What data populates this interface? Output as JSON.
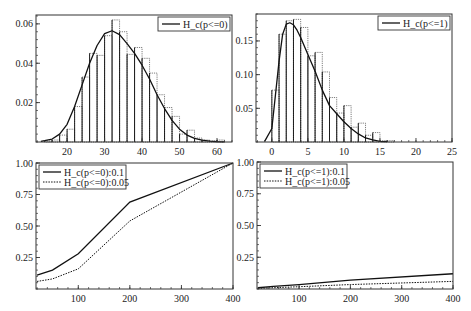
{
  "chart_data": [
    {
      "id": "hist_p0",
      "type": "bar",
      "subtype": "histogram_with_density",
      "title": "",
      "xlabel": "",
      "ylabel": "",
      "xlim": [
        11.7,
        64
      ],
      "ylim": [
        0,
        0.0645
      ],
      "xticks": [
        20,
        30,
        40,
        50,
        60
      ],
      "yticks": [
        0.02,
        0.04,
        0.06
      ],
      "ytick_labels": [
        "0.02",
        "0.04",
        "0.06"
      ],
      "xtick_labels": [
        "20",
        "30",
        "40",
        "50",
        "60"
      ],
      "grid": false,
      "legend": {
        "position": "upper right",
        "entries": [
          {
            "label": "H_c(p<=0)",
            "style": "solid"
          }
        ]
      },
      "bin_width": 2,
      "bins": [
        {
          "x0": 14,
          "h": 0.0005
        },
        {
          "x0": 16,
          "h": 0.001
        },
        {
          "x0": 18,
          "h": 0.0035
        },
        {
          "x0": 20,
          "h": 0.0065
        },
        {
          "x0": 22,
          "h": 0.018
        },
        {
          "x0": 24,
          "h": 0.033
        },
        {
          "x0": 26,
          "h": 0.045
        },
        {
          "x0": 28,
          "h": 0.044
        },
        {
          "x0": 30,
          "h": 0.054
        },
        {
          "x0": 32,
          "h": 0.062
        },
        {
          "x0": 34,
          "h": 0.056
        },
        {
          "x0": 36,
          "h": 0.0445
        },
        {
          "x0": 38,
          "h": 0.048
        },
        {
          "x0": 40,
          "h": 0.0425
        },
        {
          "x0": 42,
          "h": 0.035
        },
        {
          "x0": 44,
          "h": 0.024
        },
        {
          "x0": 46,
          "h": 0.0175
        },
        {
          "x0": 48,
          "h": 0.013
        },
        {
          "x0": 50,
          "h": 0.004
        },
        {
          "x0": 52,
          "h": 0.006
        },
        {
          "x0": 54,
          "h": 0.002
        },
        {
          "x0": 56,
          "h": 0.001
        },
        {
          "x0": 58,
          "h": 0.0005
        },
        {
          "x0": 60,
          "h": 0.001
        }
      ],
      "density": {
        "x": [
          13,
          16,
          18,
          20,
          22,
          24,
          26,
          28,
          30,
          32,
          34,
          36,
          38,
          40,
          42,
          44,
          46,
          48,
          50,
          52,
          54,
          56,
          58,
          60,
          62
        ],
        "y": [
          0.0003,
          0.0015,
          0.004,
          0.009,
          0.018,
          0.029,
          0.04,
          0.049,
          0.055,
          0.0565,
          0.0545,
          0.05,
          0.045,
          0.039,
          0.032,
          0.024,
          0.017,
          0.011,
          0.0065,
          0.0035,
          0.0018,
          0.0009,
          0.0004,
          0.0002,
          0.0001
        ]
      }
    },
    {
      "id": "hist_p1",
      "type": "bar",
      "subtype": "histogram_with_density",
      "title": "",
      "xlabel": "",
      "ylabel": "",
      "xlim": [
        -2.2,
        25
      ],
      "ylim": [
        0,
        0.19
      ],
      "xticks": [
        0,
        5,
        10,
        15,
        20,
        25
      ],
      "xtick_labels": [
        "0",
        "5",
        "10",
        "15",
        "20",
        "25"
      ],
      "yticks": [
        0.05,
        0.1,
        0.15
      ],
      "ytick_labels": [
        "0.05",
        "0.10",
        "0.15"
      ],
      "grid": false,
      "legend": {
        "position": "upper right",
        "entries": [
          {
            "label": "H_c(p<=1)",
            "style": "solid"
          }
        ]
      },
      "bin_width": 1,
      "bins": [
        {
          "x0": 0,
          "h": 0.077
        },
        {
          "x0": 1,
          "h": 0.16
        },
        {
          "x0": 2,
          "h": 0.18
        },
        {
          "x0": 3,
          "h": 0.182
        },
        {
          "x0": 4,
          "h": 0.17
        },
        {
          "x0": 5,
          "h": 0.128
        },
        {
          "x0": 6,
          "h": 0.133
        },
        {
          "x0": 7,
          "h": 0.104
        },
        {
          "x0": 8,
          "h": 0.066
        },
        {
          "x0": 9,
          "h": 0.043
        },
        {
          "x0": 10,
          "h": 0.054
        },
        {
          "x0": 11,
          "h": 0.022
        },
        {
          "x0": 12,
          "h": 0.028
        },
        {
          "x0": 13,
          "h": 0.01
        },
        {
          "x0": 14,
          "h": 0.014
        },
        {
          "x0": 15,
          "h": 0.002
        },
        {
          "x0": 16,
          "h": 0.002
        }
      ],
      "density": {
        "x": [
          -1,
          0,
          0.5,
          1,
          1.5,
          2,
          2.5,
          3,
          3.5,
          4,
          5,
          6,
          7,
          8,
          9,
          10,
          11,
          12,
          13,
          14,
          15,
          16
        ],
        "y": [
          0.001,
          0.02,
          0.07,
          0.12,
          0.16,
          0.175,
          0.177,
          0.174,
          0.166,
          0.155,
          0.13,
          0.105,
          0.077,
          0.054,
          0.042,
          0.03,
          0.02,
          0.012,
          0.006,
          0.003,
          0.001,
          0.0005
        ]
      }
    },
    {
      "id": "power_p0",
      "type": "line",
      "title": "",
      "xlabel": "",
      "ylabel": "",
      "xlim": [
        18,
        400
      ],
      "ylim": [
        0,
        1.0
      ],
      "xticks": [
        100,
        200,
        300,
        400
      ],
      "xtick_labels": [
        "100",
        "200",
        "300",
        "400"
      ],
      "yticks": [
        0.25,
        0.5,
        0.75,
        1.0
      ],
      "ytick_labels": [
        "0.25",
        "0.50",
        "0.75",
        "1.00"
      ],
      "grid": false,
      "legend": {
        "position": "upper left"
      },
      "x": [
        20,
        50,
        100,
        200,
        400
      ],
      "series": [
        {
          "name": "H_c(p<=0):0.1",
          "style": "solid",
          "values": [
            0.11,
            0.15,
            0.28,
            0.69,
            1.0
          ]
        },
        {
          "name": "H_c(p<=0):0.05",
          "style": "dotted",
          "values": [
            0.06,
            0.08,
            0.16,
            0.54,
            1.0
          ]
        }
      ]
    },
    {
      "id": "power_p1",
      "type": "line",
      "title": "",
      "xlabel": "",
      "ylabel": "",
      "xlim": [
        18,
        400
      ],
      "ylim": [
        0,
        1.0
      ],
      "xticks": [
        100,
        200,
        300,
        400
      ],
      "xtick_labels": [
        "100",
        "200",
        "300",
        "400"
      ],
      "yticks": [
        0.25,
        0.5,
        0.75,
        1.0
      ],
      "ytick_labels": [
        "0.25",
        "0.50",
        "0.75",
        "1.00"
      ],
      "grid": false,
      "legend": {
        "position": "upper left"
      },
      "x": [
        20,
        50,
        100,
        200,
        400
      ],
      "series": [
        {
          "name": "H_c(p<=1):0.1",
          "style": "solid",
          "values": [
            0.01,
            0.02,
            0.035,
            0.07,
            0.12
          ]
        },
        {
          "name": "H_c(p<=1):0.05",
          "style": "dotted",
          "values": [
            0.005,
            0.01,
            0.018,
            0.035,
            0.06
          ]
        }
      ]
    }
  ],
  "layout": {
    "panels": [
      {
        "x0": 36,
        "y0": 15,
        "x1": 232,
        "y1": 142
      },
      {
        "x0": 256,
        "y0": 14,
        "x1": 452,
        "y1": 142
      },
      {
        "x0": 36,
        "y0": 163,
        "x1": 233,
        "y1": 289
      },
      {
        "x0": 257,
        "y0": 162,
        "x1": 453,
        "y1": 289
      }
    ],
    "colors": {
      "line": "#111111",
      "frame": "#333333",
      "bar_edge": "#444444",
      "background": "#ffffff"
    }
  }
}
